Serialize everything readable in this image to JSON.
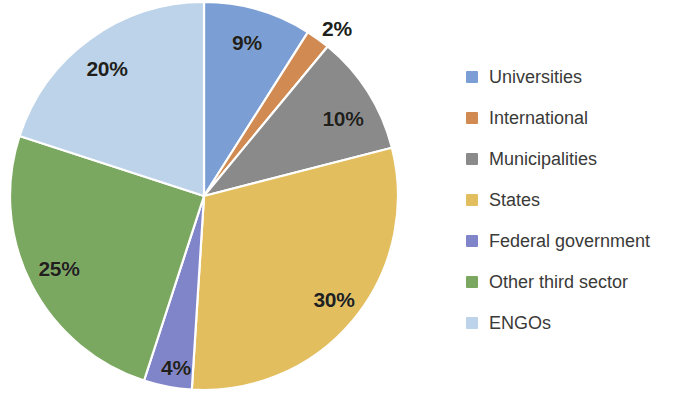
{
  "chart_data": {
    "type": "pie",
    "title": "",
    "subtitle": "",
    "xlabel": "",
    "ylabel": "",
    "grid": false,
    "legend_position": "right",
    "start_angle_deg": 0,
    "direction": "clockwise",
    "units": "percent",
    "total": 100,
    "categories": [
      "Universities",
      "International",
      "Municipalities",
      "States",
      "Federal government",
      "Other third sector",
      "ENGOs"
    ],
    "values": [
      9,
      2,
      10,
      30,
      4,
      25,
      20
    ],
    "data_labels": [
      "9%",
      "2%",
      "10%",
      "30%",
      "4%",
      "25%",
      "20%"
    ],
    "colors": [
      "#7b9fd4",
      "#d08a52",
      "#8a8a8a",
      "#e3be5e",
      "#8084c8",
      "#7ba860",
      "#bcd3ea"
    ],
    "slices": [
      {
        "label": "Universities",
        "value": 9,
        "data_label": "9%",
        "color": "#7b9fd4",
        "label_x": 247,
        "label_y": 42
      },
      {
        "label": "International",
        "value": 2,
        "data_label": "2%",
        "color": "#d08a52",
        "label_x": 337,
        "label_y": 28
      },
      {
        "label": "Municipalities",
        "value": 10,
        "data_label": "10%",
        "color": "#8a8a8a",
        "label_x": 343,
        "label_y": 118
      },
      {
        "label": "States",
        "value": 30,
        "data_label": "30%",
        "color": "#e3be5e",
        "label_x": 334,
        "label_y": 299
      },
      {
        "label": "Federal government",
        "value": 4,
        "data_label": "4%",
        "color": "#8084c8",
        "label_x": 176,
        "label_y": 367
      },
      {
        "label": "Other third sector",
        "value": 25,
        "data_label": "25%",
        "color": "#7ba860",
        "label_x": 59,
        "label_y": 268
      },
      {
        "label": "ENGOs",
        "value": 20,
        "data_label": "20%",
        "color": "#bcd3ea",
        "label_x": 107,
        "label_y": 68
      }
    ],
    "geometry": {
      "center_x": 204,
      "center_y": 196,
      "radius": 194
    }
  },
  "legend": {
    "items": [
      {
        "label": "Universities",
        "color": "#7b9fd4"
      },
      {
        "label": "International",
        "color": "#d08a52"
      },
      {
        "label": "Municipalities",
        "color": "#8a8a8a"
      },
      {
        "label": "States",
        "color": "#e3be5e"
      },
      {
        "label": "Federal government",
        "color": "#8084c8"
      },
      {
        "label": "Other third sector",
        "color": "#7ba860"
      },
      {
        "label": "ENGOs",
        "color": "#bcd3ea"
      }
    ]
  }
}
